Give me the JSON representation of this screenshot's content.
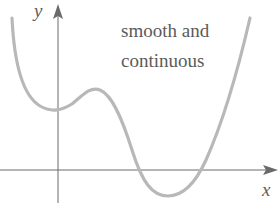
{
  "diagram": {
    "caption_lines": [
      "smooth and",
      "continuous"
    ],
    "axes": {
      "x_label": "x",
      "y_label": "y"
    },
    "colors": {
      "curve": "#b8b8b8",
      "axes": "#6a6a6a",
      "text": "#5a5a5a",
      "background": "#ffffff"
    },
    "curve_description": "Smooth continuous quartic-like curve: falls from upper left to a local minimum just left of the y-axis, rises to a local maximum, falls below the x-axis to a global minimum, then rises steeply to upper right.",
    "curve_points": [
      [
        12,
        18
      ],
      [
        20,
        70
      ],
      [
        35,
        100
      ],
      [
        50,
        110
      ],
      [
        62,
        108
      ],
      [
        80,
        96
      ],
      [
        95,
        88
      ],
      [
        110,
        95
      ],
      [
        125,
        130
      ],
      [
        138,
        170
      ],
      [
        150,
        188
      ],
      [
        168,
        195
      ],
      [
        185,
        190
      ],
      [
        202,
        170
      ],
      [
        220,
        130
      ],
      [
        238,
        75
      ],
      [
        250,
        18
      ]
    ]
  }
}
